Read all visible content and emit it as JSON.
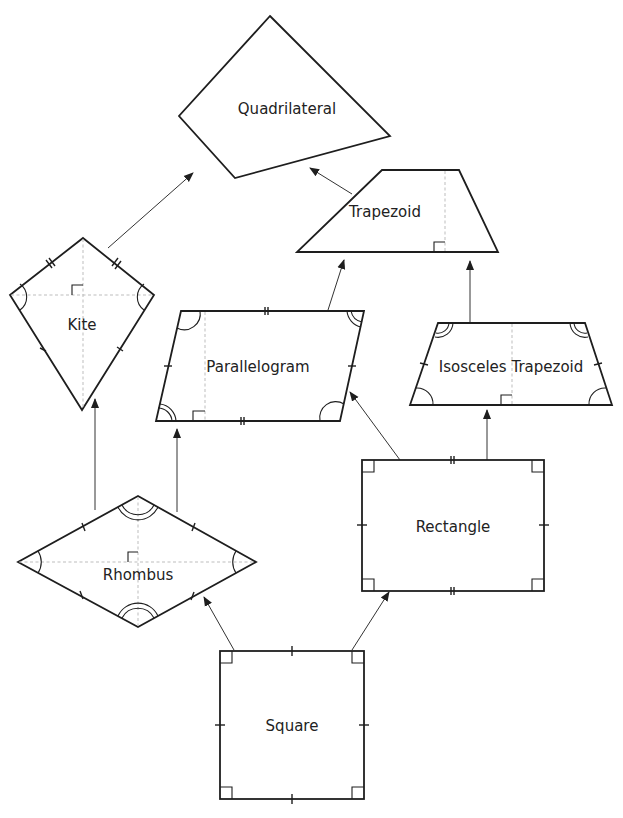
{
  "diagram": {
    "shapes": {
      "quadrilateral": {
        "label": "Quadrilateral"
      },
      "trapezoid": {
        "label": "Trapezoid"
      },
      "kite": {
        "label": "Kite"
      },
      "parallelogram": {
        "label": "Parallelogram"
      },
      "isosceles_trapezoid": {
        "label": "Isosceles Trapezoid"
      },
      "rectangle": {
        "label": "Rectangle"
      },
      "rhombus": {
        "label": "Rhombus"
      },
      "square": {
        "label": "Square"
      }
    },
    "edges": [
      {
        "from": "Kite",
        "to": "Quadrilateral"
      },
      {
        "from": "Trapezoid",
        "to": "Quadrilateral"
      },
      {
        "from": "Parallelogram",
        "to": "Trapezoid"
      },
      {
        "from": "Isosceles Trapezoid",
        "to": "Trapezoid"
      },
      {
        "from": "Rhombus",
        "to": "Kite"
      },
      {
        "from": "Rhombus",
        "to": "Parallelogram"
      },
      {
        "from": "Rectangle",
        "to": "Parallelogram"
      },
      {
        "from": "Rectangle",
        "to": "Isosceles Trapezoid"
      },
      {
        "from": "Square",
        "to": "Rhombus"
      },
      {
        "from": "Square",
        "to": "Rectangle"
      }
    ],
    "colors": {
      "stroke": "#1e1e1e",
      "dashed": "#b5b5b5",
      "background": "#ffffff"
    }
  }
}
